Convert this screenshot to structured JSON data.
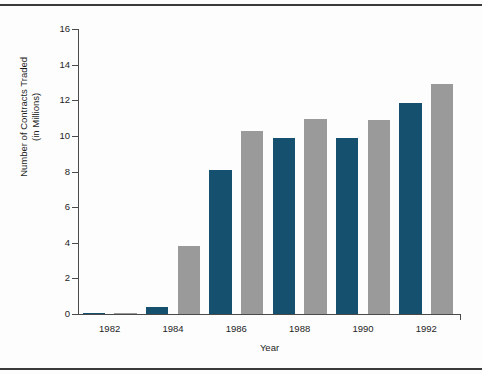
{
  "chart_data": {
    "type": "bar",
    "title": "",
    "xlabel": "Year",
    "ylabel_line1": "Number of Contracts Traded",
    "ylabel_line2": "(in Millions)",
    "ylim": [
      0,
      16
    ],
    "yticks": [
      0,
      2,
      4,
      6,
      8,
      10,
      12,
      14,
      16
    ],
    "xtick_labels": [
      "1982",
      "1984",
      "1986",
      "1988",
      "1990",
      "1992"
    ],
    "grid": false,
    "legend": "none",
    "categories": [
      "1982",
      "1983",
      "1984",
      "1985",
      "1986",
      "1987",
      "1988",
      "1989",
      "1990",
      "1991",
      "1992",
      "1993"
    ],
    "values": [
      0.03,
      0.05,
      0.4,
      3.8,
      8.1,
      10.25,
      9.9,
      10.95,
      9.9,
      10.9,
      11.85,
      12.9
    ],
    "bar_colors": [
      "#15506e",
      "#9a9a9a",
      "#15506e",
      "#9a9a9a",
      "#15506e",
      "#9a9a9a",
      "#15506e",
      "#9a9a9a",
      "#15506e",
      "#9a9a9a",
      "#15506e",
      "#9a9a9a"
    ],
    "color_blue": "#15506e",
    "color_gray": "#9a9a9a"
  }
}
